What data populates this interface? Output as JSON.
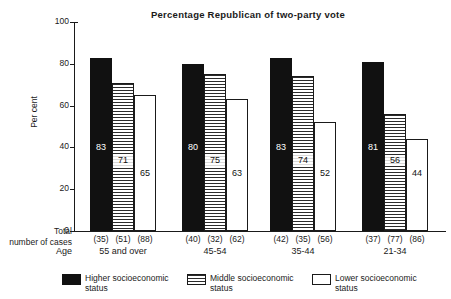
{
  "chart_data": {
    "type": "bar",
    "title": "Percentage Republican of two-party vote",
    "xlabel": "Age",
    "ylabel": "Per cent",
    "ylim": [
      0,
      100
    ],
    "yticks": [
      0,
      20,
      40,
      60,
      80,
      100
    ],
    "grid": false,
    "legend_position": "bottom",
    "categories": [
      "55 and over",
      "45-54",
      "35-44",
      "21-34"
    ],
    "series": [
      {
        "name": "Higher socioeconomic status",
        "fill": "solid-black",
        "values": [
          83,
          80,
          83,
          81
        ],
        "case_counts": [
          "(35)",
          "(40)",
          "(42)",
          "(37)"
        ]
      },
      {
        "name": "Middle socioeconomic status",
        "fill": "horizontal-hatch",
        "values": [
          71,
          75,
          74,
          56
        ],
        "case_counts": [
          "(51)",
          "(32)",
          "(35)",
          "(77)"
        ]
      },
      {
        "name": "Lower socioeconomic status",
        "fill": "white",
        "values": [
          65,
          63,
          52,
          44
        ],
        "case_counts": [
          "(88)",
          "(62)",
          "(56)",
          "(86)"
        ]
      }
    ]
  },
  "axis": {
    "y_label": "Per cent",
    "y_tick_labels": [
      "0",
      "20",
      "40",
      "60",
      "80",
      "100"
    ],
    "total_cases_line1": "Total",
    "total_cases_line2": "number of cases",
    "age_label": "Age"
  },
  "groups": [
    {
      "label": "55 and over",
      "bars": [
        {
          "value": "83",
          "cases": "(35)"
        },
        {
          "value": "71",
          "cases": "(51)"
        },
        {
          "value": "65",
          "cases": "(88)"
        }
      ]
    },
    {
      "label": "45-54",
      "bars": [
        {
          "value": "80",
          "cases": "(40)"
        },
        {
          "value": "75",
          "cases": "(32)"
        },
        {
          "value": "63",
          "cases": "(62)"
        }
      ]
    },
    {
      "label": "35-44",
      "bars": [
        {
          "value": "83",
          "cases": "(42)"
        },
        {
          "value": "74",
          "cases": "(35)"
        },
        {
          "value": "52",
          "cases": "(56)"
        }
      ]
    },
    {
      "label": "21-34",
      "bars": [
        {
          "value": "81",
          "cases": "(37)"
        },
        {
          "value": "56",
          "cases": "(77)"
        },
        {
          "value": "44",
          "cases": "(86)"
        }
      ]
    }
  ],
  "legend": {
    "items": [
      {
        "line1": "Higher  socioeconomic",
        "line2": "status",
        "swatch": "solid-black"
      },
      {
        "line1": "Middle  socioeconomic",
        "line2": "status",
        "swatch": "horizontal-hatch"
      },
      {
        "line1": "Lower  socioeconomic",
        "line2": "status",
        "swatch": "white"
      }
    ]
  },
  "colors": {
    "ink": "#1a1a1a",
    "higher": "#111111",
    "middle_hatch": "#2b2b2b",
    "lower": "#ffffff",
    "background": "#ffffff"
  }
}
